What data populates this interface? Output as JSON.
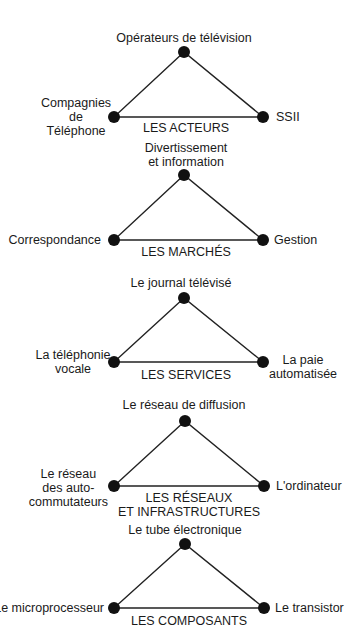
{
  "diagram": {
    "stroke_color": "#222222",
    "node_color": "#111111",
    "triangles": [
      {
        "title": [
          "LES ACTEURS"
        ],
        "top": [
          "Opérateurs de télévision"
        ],
        "left": [
          "Compagnies",
          "de",
          "Téléphone"
        ],
        "right": [
          "SSII"
        ]
      },
      {
        "title": [
          "LES MARCHÉS"
        ],
        "top": [
          "Divertissement",
          "et information"
        ],
        "left": [
          "Correspondance"
        ],
        "right": [
          "Gestion"
        ]
      },
      {
        "title": [
          "LES SERVICES"
        ],
        "top": [
          "Le journal télévisé"
        ],
        "left": [
          "La téléphonie",
          "vocale"
        ],
        "right": [
          "La paie",
          "automatisée"
        ]
      },
      {
        "title": [
          "LES RÉSEAUX",
          "ET INFRASTRUCTURES"
        ],
        "top": [
          "Le réseau de diffusion"
        ],
        "left": [
          "Le réseau",
          "des auto-",
          "commutateurs"
        ],
        "right": [
          "L'ordinateur"
        ]
      },
      {
        "title": [
          "LES COMPOSANTS"
        ],
        "top": [
          "Le tube électronique"
        ],
        "left": [
          "Le microprocesseur"
        ],
        "right": [
          "Le transistor"
        ]
      }
    ]
  }
}
